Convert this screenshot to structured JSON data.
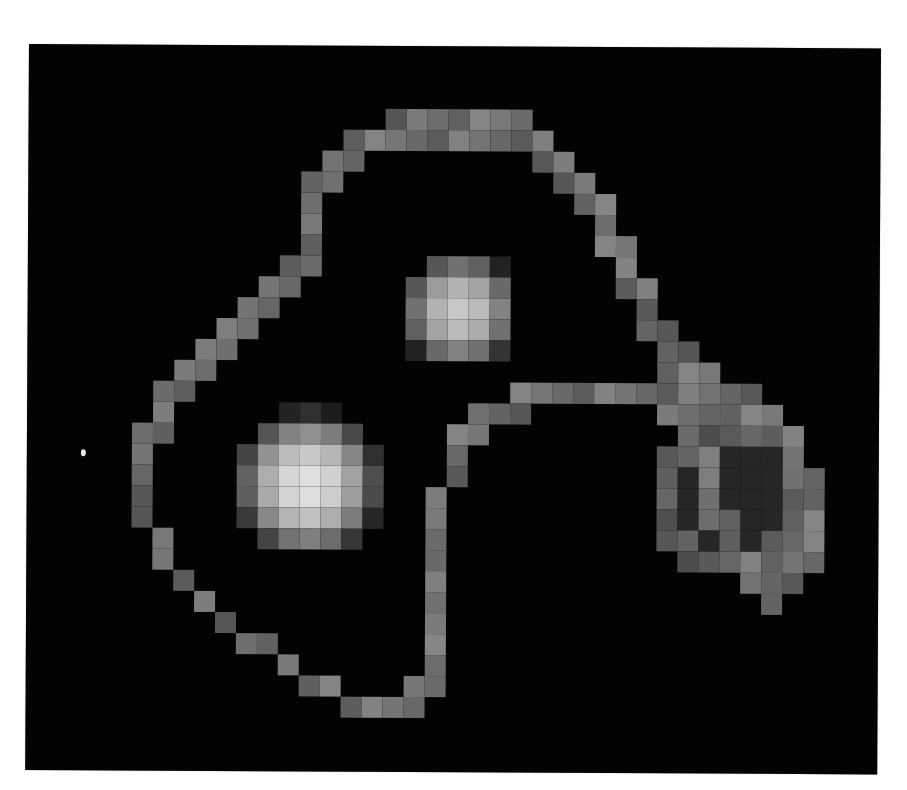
{
  "image": {
    "background": "#ffffff",
    "panel_color": "#030303",
    "cell_size": 21,
    "grid": {
      "cols": 41,
      "rows": 35
    },
    "description": "Pixelated grayscale intensity map with two bright blobs enclosed by a figure-eight contour and a ring-shaped lobe on the right"
  },
  "features": {
    "blobs": [
      {
        "name": "lower-left-blob",
        "cx": 13.4,
        "cy": 20.9,
        "radius": 3.6,
        "peak": 235
      },
      {
        "name": "upper-blob",
        "cx": 20.6,
        "cy": 12.6,
        "radius": 2.9,
        "peak": 205
      }
    ],
    "ring": {
      "name": "right-ring-lobe",
      "cx": 33.6,
      "cy": 21.2,
      "rx": 3.4,
      "ry": 3.6,
      "gray": 105
    },
    "speck": {
      "x": 83,
      "y": 449
    }
  },
  "contour": {
    "gray": 110,
    "cells": [
      [
        17,
        3
      ],
      [
        18,
        3
      ],
      [
        19,
        3
      ],
      [
        20,
        3
      ],
      [
        21,
        3
      ],
      [
        22,
        3
      ],
      [
        23,
        3
      ],
      [
        15,
        4
      ],
      [
        16,
        4
      ],
      [
        17,
        4
      ],
      [
        18,
        4
      ],
      [
        19,
        4
      ],
      [
        20,
        4
      ],
      [
        21,
        4
      ],
      [
        22,
        4
      ],
      [
        23,
        4
      ],
      [
        24,
        4
      ],
      [
        14,
        5
      ],
      [
        15,
        5
      ],
      [
        24,
        5
      ],
      [
        25,
        5
      ],
      [
        14,
        6
      ],
      [
        13,
        6
      ],
      [
        25,
        6
      ],
      [
        26,
        6
      ],
      [
        13,
        7
      ],
      [
        26,
        7
      ],
      [
        27,
        7
      ],
      [
        13,
        8
      ],
      [
        27,
        8
      ],
      [
        13,
        9
      ],
      [
        27,
        9
      ],
      [
        28,
        9
      ],
      [
        13,
        10
      ],
      [
        12,
        10
      ],
      [
        28,
        10
      ],
      [
        11,
        11
      ],
      [
        12,
        11
      ],
      [
        28,
        11
      ],
      [
        29,
        11
      ],
      [
        10,
        12
      ],
      [
        11,
        12
      ],
      [
        29,
        12
      ],
      [
        9,
        13
      ],
      [
        10,
        13
      ],
      [
        29,
        13
      ],
      [
        30,
        13
      ],
      [
        8,
        14
      ],
      [
        9,
        14
      ],
      [
        30,
        14
      ],
      [
        31,
        14
      ],
      [
        7,
        15
      ],
      [
        8,
        15
      ],
      [
        30,
        15
      ],
      [
        31,
        15
      ],
      [
        32,
        15
      ],
      [
        6,
        16
      ],
      [
        7,
        16
      ],
      [
        23,
        16
      ],
      [
        24,
        16
      ],
      [
        25,
        16
      ],
      [
        26,
        16
      ],
      [
        27,
        16
      ],
      [
        28,
        16
      ],
      [
        29,
        16
      ],
      [
        30,
        16
      ],
      [
        31,
        16
      ],
      [
        32,
        16
      ],
      [
        33,
        16
      ],
      [
        34,
        16
      ],
      [
        6,
        17
      ],
      [
        21,
        17
      ],
      [
        22,
        17
      ],
      [
        23,
        17
      ],
      [
        30,
        17
      ],
      [
        31,
        17
      ],
      [
        33,
        17
      ],
      [
        34,
        17
      ],
      [
        35,
        17
      ],
      [
        5,
        18
      ],
      [
        6,
        18
      ],
      [
        20,
        18
      ],
      [
        21,
        18
      ],
      [
        31,
        18
      ],
      [
        35,
        18
      ],
      [
        36,
        18
      ],
      [
        5,
        19
      ],
      [
        20,
        19
      ],
      [
        31,
        19
      ],
      [
        32,
        19
      ],
      [
        36,
        19
      ],
      [
        5,
        20
      ],
      [
        20,
        20
      ],
      [
        32,
        20
      ],
      [
        36,
        20
      ],
      [
        37,
        20
      ],
      [
        5,
        21
      ],
      [
        19,
        21
      ],
      [
        32,
        21
      ],
      [
        37,
        21
      ],
      [
        5,
        22
      ],
      [
        19,
        22
      ],
      [
        32,
        22
      ],
      [
        33,
        22
      ],
      [
        37,
        22
      ],
      [
        6,
        23
      ],
      [
        19,
        23
      ],
      [
        33,
        23
      ],
      [
        37,
        23
      ],
      [
        6,
        24
      ],
      [
        19,
        24
      ],
      [
        33,
        24
      ],
      [
        34,
        24
      ],
      [
        36,
        24
      ],
      [
        37,
        24
      ],
      [
        7,
        25
      ],
      [
        19,
        25
      ],
      [
        34,
        25
      ],
      [
        35,
        25
      ],
      [
        36,
        25
      ],
      [
        8,
        26
      ],
      [
        19,
        26
      ],
      [
        35,
        26
      ],
      [
        9,
        27
      ],
      [
        19,
        27
      ],
      [
        10,
        28
      ],
      [
        11,
        28
      ],
      [
        19,
        28
      ],
      [
        12,
        29
      ],
      [
        19,
        29
      ],
      [
        13,
        30
      ],
      [
        14,
        30
      ],
      [
        18,
        30
      ],
      [
        19,
        30
      ],
      [
        15,
        31
      ],
      [
        16,
        31
      ],
      [
        17,
        31
      ],
      [
        18,
        31
      ]
    ]
  }
}
